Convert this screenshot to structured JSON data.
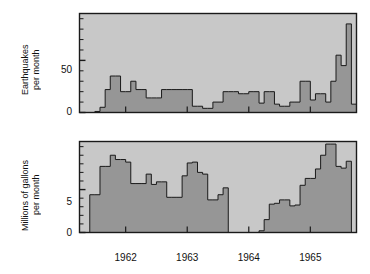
{
  "figure": {
    "background": "#ffffff",
    "plot_background": "#c8c8c8",
    "fill_color": "#969696",
    "line_color": "#1a1a1a"
  },
  "panels": [
    {
      "id": "earthquake-frequency",
      "title": "Earthquake frequency",
      "ylabel_line1": "Earthquakes",
      "ylabel_line2": "per month",
      "yticks_major": [
        {
          "value": 0,
          "label": "0"
        },
        {
          "value": 50,
          "label": "50"
        }
      ],
      "yticks_minor": [
        10,
        20,
        30,
        40,
        60,
        70,
        80,
        90
      ],
      "ylim": [
        0,
        95
      ]
    },
    {
      "id": "waste-fluid-injected",
      "title": "Waste fluid injected",
      "ylabel_line1": "Millions of gallons",
      "ylabel_line2": "per month",
      "yticks_major": [
        {
          "value": 0,
          "label": "0"
        },
        {
          "value": 5,
          "label": "5"
        }
      ],
      "yticks_minor": [
        1,
        2,
        3,
        4,
        6,
        7,
        8,
        9,
        10
      ],
      "ylim": [
        0,
        10.6
      ]
    }
  ],
  "xaxis": {
    "ticks": [
      {
        "value": 1962.0,
        "label": "1962"
      },
      {
        "value": 1963.0,
        "label": "1963"
      },
      {
        "value": 1964.0,
        "label": "1964"
      },
      {
        "value": 1965.0,
        "label": "1965"
      }
    ],
    "xlim": [
      1961.25,
      1965.75
    ]
  },
  "chart_data": [
    {
      "type": "area",
      "id": "earthquake-frequency",
      "title": "Earthquake frequency",
      "xlabel": "",
      "ylabel": "Earthquakes per month",
      "ylim": [
        0,
        95
      ],
      "xlim": [
        1961.25,
        1965.75
      ],
      "grid": false,
      "legend": "none",
      "step": "post",
      "xtick_labels": [
        "1962",
        "1963",
        "1964",
        "1965"
      ],
      "ytick_labels": [
        "0",
        "50"
      ],
      "x": [
        1961.25,
        1961.333,
        1961.417,
        1961.5,
        1961.583,
        1961.667,
        1961.75,
        1961.833,
        1961.917,
        1962.0,
        1962.083,
        1962.167,
        1962.25,
        1962.333,
        1962.417,
        1962.5,
        1962.583,
        1962.667,
        1962.75,
        1962.833,
        1962.917,
        1963.0,
        1963.083,
        1963.167,
        1963.25,
        1963.333,
        1963.417,
        1963.5,
        1963.583,
        1963.667,
        1963.75,
        1963.833,
        1963.917,
        1964.0,
        1964.083,
        1964.167,
        1964.25,
        1964.333,
        1964.417,
        1964.5,
        1964.583,
        1964.667,
        1964.75,
        1964.833,
        1964.917,
        1965.0,
        1965.083,
        1965.167,
        1965.25,
        1965.333,
        1965.417,
        1965.5,
        1965.583,
        1965.667
      ],
      "values": [
        0,
        0,
        0,
        1,
        5,
        22,
        35,
        35,
        20,
        20,
        30,
        22,
        22,
        14,
        14,
        14,
        22,
        22,
        22,
        22,
        22,
        22,
        6,
        6,
        4,
        4,
        10,
        10,
        20,
        20,
        20,
        18,
        18,
        20,
        20,
        9,
        20,
        20,
        8,
        6,
        6,
        10,
        10,
        30,
        30,
        12,
        18,
        18,
        10,
        30,
        55,
        45,
        85,
        8
      ]
    },
    {
      "type": "area",
      "id": "waste-fluid-injected",
      "title": "Waste fluid injected",
      "xlabel": "",
      "ylabel": "Millions of gallons per month",
      "ylim": [
        0,
        10.6
      ],
      "xlim": [
        1961.25,
        1965.75
      ],
      "grid": false,
      "legend": "none",
      "step": "post",
      "xtick_labels": [
        "1962",
        "1963",
        "1964",
        "1965"
      ],
      "ytick_labels": [
        "0",
        "5"
      ],
      "x": [
        1961.25,
        1961.333,
        1961.417,
        1961.5,
        1961.583,
        1961.667,
        1961.75,
        1961.833,
        1961.917,
        1962.0,
        1962.083,
        1962.167,
        1962.25,
        1962.333,
        1962.417,
        1962.5,
        1962.583,
        1962.667,
        1962.75,
        1962.833,
        1962.917,
        1963.0,
        1963.083,
        1963.167,
        1963.25,
        1963.333,
        1963.417,
        1963.5,
        1963.583,
        1963.667,
        1963.75,
        1963.833,
        1963.917,
        1964.0,
        1964.083,
        1964.167,
        1964.25,
        1964.333,
        1964.417,
        1964.5,
        1964.583,
        1964.667,
        1964.75,
        1964.833,
        1964.917,
        1965.0,
        1965.083,
        1965.167,
        1965.25,
        1965.333,
        1965.417,
        1965.5,
        1965.583,
        1965.667
      ],
      "values": [
        0,
        0,
        4.4,
        4.4,
        7.7,
        7.7,
        9.0,
        8.5,
        8.5,
        8.2,
        5.7,
        5.7,
        5.7,
        6.8,
        5.6,
        5.9,
        5.9,
        4.1,
        4.1,
        4.1,
        6.6,
        8.1,
        8.2,
        7.0,
        6.8,
        3.8,
        3.8,
        4.4,
        5.2,
        0,
        0,
        0,
        0,
        0,
        0,
        0.2,
        1.5,
        3.3,
        3.4,
        3.8,
        3.8,
        3.1,
        3.2,
        5.5,
        6.3,
        6.3,
        7.4,
        9.0,
        10.3,
        10.3,
        7.7,
        7.5,
        8.3,
        0
      ]
    }
  ]
}
